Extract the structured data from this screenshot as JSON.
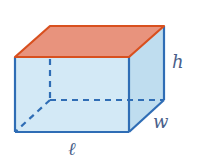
{
  "diagram": {
    "type": "rectangular-prism",
    "labels": {
      "height": "h",
      "width": "w",
      "length": "ℓ"
    },
    "colors": {
      "edge": "#2f6db5",
      "front_face": "#d3e9f6",
      "side_face": "#bfddef",
      "top_face": "#e8937d",
      "top_edge": "#d8501f",
      "label": "#4a5f8a"
    },
    "vertices": {
      "front_top_left": [
        15,
        57
      ],
      "front_top_right": [
        129,
        57
      ],
      "front_bottom_left": [
        15,
        132
      ],
      "front_bottom_right": [
        129,
        132
      ],
      "back_top_left": [
        50,
        26
      ],
      "back_top_right": [
        164,
        26
      ],
      "back_bottom_left": [
        50,
        100
      ],
      "back_bottom_right": [
        164,
        100
      ]
    }
  }
}
